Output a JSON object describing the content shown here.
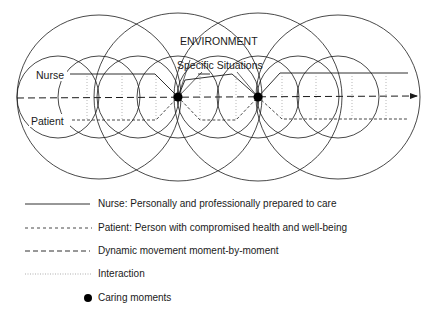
{
  "diagram": {
    "title_environment": "ENVIRONMENT",
    "label_specific_situations": "Specific Situations",
    "label_nurse": "Nurse",
    "label_patient": "Patient",
    "colors": {
      "stroke": "#1a1a1a",
      "interaction": "#9a9a9a",
      "background": "#ffffff"
    },
    "caring_moments": [
      {
        "x": 178,
        "y": 97
      },
      {
        "x": 258,
        "y": 97
      }
    ]
  },
  "legend": {
    "items": [
      {
        "style": "solid",
        "label": "Nurse: Personally and professionally prepared to care"
      },
      {
        "style": "short-dash",
        "label": "Patient: Person with compromised health and well-being"
      },
      {
        "style": "long-dash",
        "label": "Dynamic movement moment-by-moment"
      },
      {
        "style": "dotted",
        "label": "Interaction"
      },
      {
        "style": "dot",
        "label": "Caring moments"
      }
    ]
  }
}
